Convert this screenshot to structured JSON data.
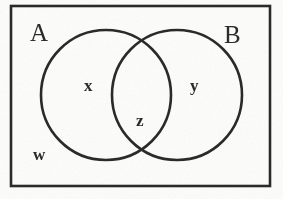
{
  "figure": {
    "kind": "venn-diagram",
    "background_color": "#fdfdfc",
    "stroke_color": "#2b2b2b"
  },
  "universal_set": {
    "name": "rectangle-border",
    "x": 11,
    "y": 6,
    "width": 259,
    "height": 180,
    "stroke_width": 2.6
  },
  "circles": [
    {
      "name": "circle-A",
      "set_label": "A",
      "cx": 106,
      "cy": 95,
      "r": 65,
      "stroke_width": 2.6
    },
    {
      "name": "circle-B",
      "set_label": "B",
      "cx": 177,
      "cy": 95,
      "r": 65,
      "stroke_width": 2.6
    }
  ],
  "set_labels": [
    {
      "id": "A",
      "text": "A",
      "position": "outside-top-left"
    },
    {
      "id": "B",
      "text": "B",
      "position": "outside-top-right"
    }
  ],
  "region_labels": [
    {
      "id": "x",
      "text": "x",
      "region": "A-only"
    },
    {
      "id": "y",
      "text": "y",
      "region": "B-only"
    },
    {
      "id": "z",
      "text": "z",
      "region": "A-intersect-B"
    },
    {
      "id": "w",
      "text": "w",
      "region": "outside-both-sets"
    }
  ]
}
